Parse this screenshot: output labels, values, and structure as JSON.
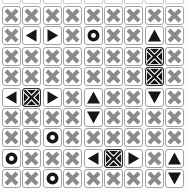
{
  "board": {
    "columns": 9,
    "rows_count": 9,
    "rows": [
      [
        "x",
        "x",
        "x",
        "x",
        "x",
        "x",
        "x",
        "x",
        "x"
      ],
      [
        "x",
        "left",
        "right",
        "x",
        "ring",
        "x",
        "x",
        "up",
        "x"
      ],
      [
        "x",
        "x",
        "x",
        "x",
        "x",
        "x",
        "x",
        "inv",
        "x"
      ],
      [
        "x",
        "x",
        "x",
        "x",
        "x",
        "x",
        "x",
        "inv",
        "x"
      ],
      [
        "left",
        "inv",
        "right",
        "x",
        "up",
        "x",
        "x",
        "down",
        "x"
      ],
      [
        "x",
        "x",
        "x",
        "x",
        "down",
        "x",
        "x",
        "x",
        "x"
      ],
      [
        "x",
        "x",
        "ring",
        "x",
        "x",
        "x",
        "x",
        "x",
        "x"
      ],
      [
        "ring",
        "x",
        "x",
        "x",
        "left",
        "inv",
        "right",
        "x",
        "up"
      ],
      [
        "x",
        "x",
        "ring",
        "x",
        "x",
        "x",
        "x",
        "x",
        "down"
      ]
    ],
    "cell_icons": {
      "x": "x-icon",
      "inv": "inverted-x-icon",
      "ring": "circle-icon",
      "left": "triangle-left-icon",
      "right": "triangle-right-icon",
      "up": "triangle-up-icon",
      "down": "triangle-down-icon"
    },
    "colors": {
      "page_bg": "#fcfcfc",
      "tile_bg": "#ffffff",
      "tile_border": "#a3a3a3",
      "x_gray": "#8a8a8a",
      "symbol_black": "#161616",
      "inverted_tile_bg": "#161616",
      "inverted_x_outline": "#ffffff"
    }
  }
}
